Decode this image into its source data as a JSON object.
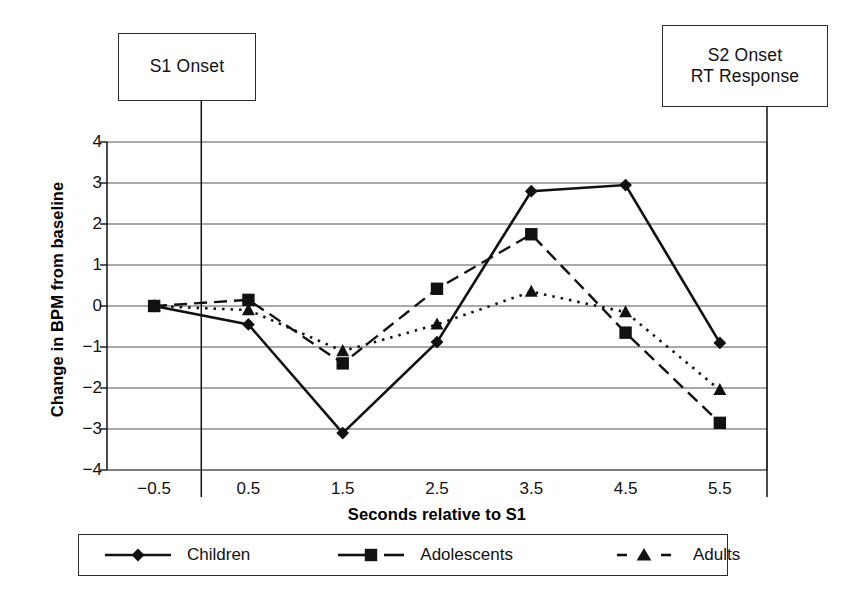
{
  "chart_data": {
    "type": "line",
    "title": "",
    "xlabel": "Seconds relative to S1",
    "ylabel": "Change in BPM from baseline",
    "x": [
      -0.5,
      0.5,
      1.5,
      2.5,
      3.5,
      4.5,
      5.5
    ],
    "xticklabels": [
      "−0.5",
      "0.5",
      "1.5",
      "2.5",
      "3.5",
      "4.5",
      "5.5"
    ],
    "yticklabels": [
      "4",
      "3",
      "2",
      "1",
      "0",
      "−1",
      "−2",
      "−3",
      "−4"
    ],
    "xlim": [
      -1.0,
      6.0
    ],
    "ylim": [
      -4,
      4
    ],
    "grid": "horizontal",
    "legend_position": "below-axis",
    "series": [
      {
        "name": "Children",
        "marker": "diamond",
        "line": "solid",
        "values": [
          0.0,
          -0.45,
          -3.1,
          -0.88,
          2.8,
          2.95,
          -0.9
        ]
      },
      {
        "name": "Adolescents",
        "marker": "square",
        "line": "dashed",
        "values": [
          0.0,
          0.15,
          -1.4,
          0.42,
          1.75,
          -0.65,
          -2.85
        ]
      },
      {
        "name": "Adults",
        "marker": "triangle",
        "line": "dotted",
        "values": [
          0.0,
          -0.1,
          -1.1,
          -0.45,
          0.35,
          -0.15,
          -2.05
        ]
      }
    ],
    "annotations": [
      {
        "id": "s1",
        "text": "S1 Onset",
        "at_x": 0.0
      },
      {
        "id": "s2",
        "text": "S2 Onset\nRT Response",
        "at_x": 6.0
      }
    ]
  },
  "callouts": {
    "s1": "S1 Onset",
    "s2_line1": "S2 Onset",
    "s2_line2": "RT Response"
  },
  "axes": {
    "y_title": "Change in BPM from baseline",
    "x_title": "Seconds relative to S1"
  },
  "legend": {
    "items": [
      {
        "label": "Children",
        "marker": "diamond-marker-icon"
      },
      {
        "label": "Adolescents",
        "marker": "square-marker-icon"
      },
      {
        "label": "Adults",
        "marker": "triangle-marker-icon"
      }
    ]
  },
  "colors": {
    "ink": "#111111",
    "grid": "#555555",
    "background": "#ffffff"
  }
}
